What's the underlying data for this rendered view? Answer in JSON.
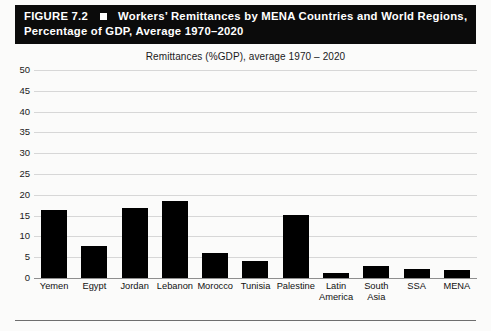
{
  "header": {
    "figure_number": "FIGURE 7.2",
    "marker_icon": "filled-square-icon",
    "title_line1": "Workers’ Remittances by MENA Countries and World Regions,",
    "title_line2": "Percentage of GDP, Average 1970–2020",
    "background_color": "#0b0b0b",
    "text_color": "#ffffff"
  },
  "chart_data": {
    "type": "bar",
    "title": "Remittances (%GDP), average 1970 – 2020",
    "xlabel": "",
    "ylabel": "",
    "ylim": [
      0,
      50
    ],
    "ytick_step": 5,
    "yticks": [
      "50",
      "45",
      "40",
      "35",
      "30",
      "25",
      "20",
      "15",
      "10",
      "5",
      "0"
    ],
    "grid": true,
    "legend": "none",
    "bar_color": "#000000",
    "categories": [
      "Yemen",
      "Egypt",
      "Jordan",
      "Lebanon",
      "Morocco",
      "Tunisia",
      "Palestine",
      "Latin\nAmerica",
      "South\nAsia",
      "SSA",
      "MENA"
    ],
    "values": [
      16.3,
      7.6,
      16.8,
      18.5,
      6.0,
      4.2,
      15.2,
      1.3,
      3.0,
      2.2,
      2.0
    ]
  }
}
